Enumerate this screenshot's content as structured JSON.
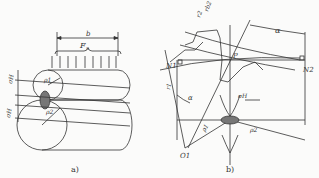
{
  "figure_a": {
    "caption": "a)",
    "labels": {
      "width": "b",
      "force": "F",
      "force_sub": "n",
      "stress_top": "σH",
      "stress_bottom": "σH",
      "rho1": "ρ1",
      "rho2": "ρ2"
    }
  },
  "figure_b": {
    "caption": "b)",
    "labels": {
      "r2": "r2",
      "rb2": "rb2",
      "alpha_top": "α",
      "P": "P",
      "N1": "N1",
      "N2": "N2",
      "r1": "r1",
      "alpha_left": "α",
      "sigmaH": "σH",
      "rho1": "ρ1",
      "rho2": "ρ2",
      "O1": "O1"
    }
  },
  "colors": {
    "line": "#333333",
    "fill": "#777777",
    "background": "#fbfbfa"
  }
}
